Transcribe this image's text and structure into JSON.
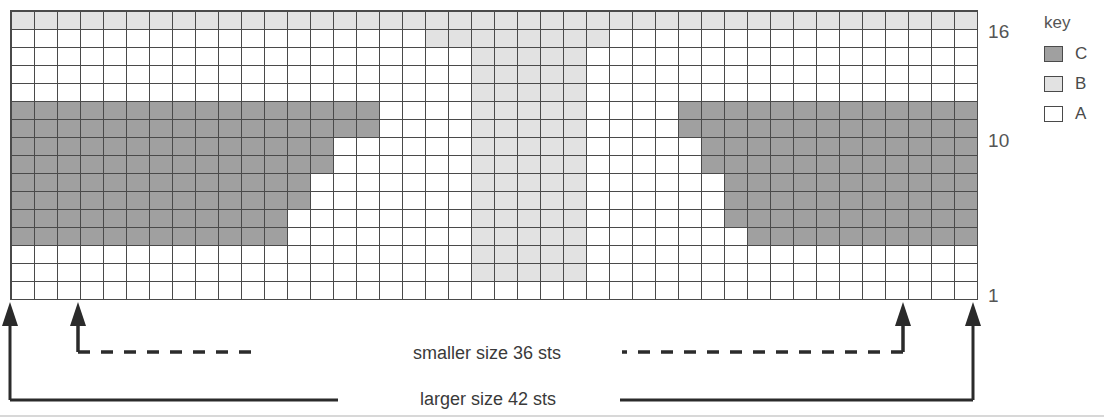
{
  "chart_data": {
    "type": "heatmap",
    "title": "",
    "columns": 42,
    "rows": 16,
    "xlabel": "stitches",
    "ylabel": "rows",
    "row_tick_labels": [
      "16",
      "10",
      "1"
    ],
    "row_ticks": [
      16,
      10,
      1
    ],
    "legend_position": "right",
    "grid": true,
    "palette": {
      "A": "#ffffff",
      "B": "#e2e2e2",
      "C": "#a0a0a0"
    },
    "categories": [
      "A",
      "B",
      "C"
    ],
    "cells_top_to_bottom": [
      "BBBBBBBBBBBBBBBBBBBBBBBBBBBBBBBBBBBBBBBBBB",
      "AAAAAAAAAAAAAAAAAABBBBBBBBAAAAAAAAAAAAAAAA",
      "AAAAAAAAAAAAAAAAAAAABBBBBAAAAAAAAAAAAAAAAA",
      "AAAAAAAAAAAAAAAAAAAABBBBBAAAAAAAAAAAAAAAAA",
      "AAAAAAAAAAAAAAAAAAAABBBBBAAAAAAAAAAAAAAAAA",
      "CCCCCCCCCCCCCCCCAAAABBBBBAAAACCCCCCCCCCCCCC",
      "CCCCCCCCCCCCCCCCAAAABBBBBAAAACCCCCCCCCCCCCC",
      "CCCCCCCCCCCCCCAAAAAABBBBBAAAAACCCCCCCCCCCCC",
      "CCCCCCCCCCCCCCAAAAAABBBBBAAAAACCCCCCCCCCCCC",
      "CCCCCCCCCCCCCAAAAAAABBBBBAAAAAACCCCCCCCCCCC",
      "CCCCCCCCCCCCCAAAAAAABBBBBAAAAAACCCCCCCCCCCC",
      "CCCCCCCCCCCCAAAAAAAABBBBBAAAAAACCCCCCCCCCCC",
      "CCCCCCCCCCCCAAAAAAAABBBBBAAAAAAACCCCCCCCCCC",
      "AAAAAAAAAAAAAAAAAAAABBBBBAAAAAAAAAAAAAAAAAA",
      "AAAAAAAAAAAAAAAAAAAABBBBBAAAAAAAAAAAAAAAAAA",
      "AAAAAAAAAAAAAAAAAAAAAAAAAAAAAAAAAAAAAAAAAA"
    ]
  },
  "key": {
    "title": "key",
    "entries": [
      {
        "symbol": "C",
        "label": "C"
      },
      {
        "symbol": "B",
        "label": "B"
      },
      {
        "symbol": "A",
        "label": "A"
      }
    ]
  },
  "row_labels": {
    "top": "16",
    "middle": "10",
    "bottom": "1"
  },
  "size_indicators": {
    "smaller": {
      "caption": "smaller size 36 sts",
      "line_style": "dashed"
    },
    "larger": {
      "caption": "larger size 42 sts",
      "line_style": "solid"
    }
  }
}
